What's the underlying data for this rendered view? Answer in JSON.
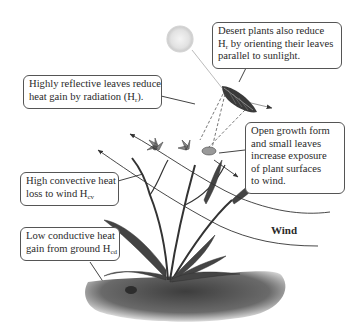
{
  "diagram": {
    "callouts": {
      "desert_orientation": {
        "line1": "Desert plants also reduce",
        "line2_pre": "H",
        "line2_sub": "r",
        "line2_post": " by orienting their leaves",
        "line3": "parallel to sunlight."
      },
      "reflective_leaves": {
        "line1": "Highly reflective leaves reduce",
        "line2_pre": "heat gain by radiation (H",
        "line2_sub": "r",
        "line2_post": ")."
      },
      "open_growth": {
        "line1": "Open growth form",
        "line2": "and small leaves",
        "line3": "increase exposure",
        "line4": "of plant surfaces",
        "line5": "to wind."
      },
      "convective": {
        "line1": "High convective heat",
        "line2_pre": "loss to wind H",
        "line2_sub": "cv"
      },
      "conductive": {
        "line1": "Low conductive heat",
        "line2_pre": "gain from ground H",
        "line2_sub": "cd"
      }
    },
    "wind_label": "Wind",
    "elements": [
      "sun",
      "leaf",
      "plant",
      "ground",
      "wind-arrows",
      "sunlight-rays"
    ],
    "colors": {
      "outline": "#555555",
      "text": "#2a2a2a",
      "sun": "#e6e6e6",
      "plant": "#4a4a4a",
      "ground": "#6a6a6a"
    }
  }
}
